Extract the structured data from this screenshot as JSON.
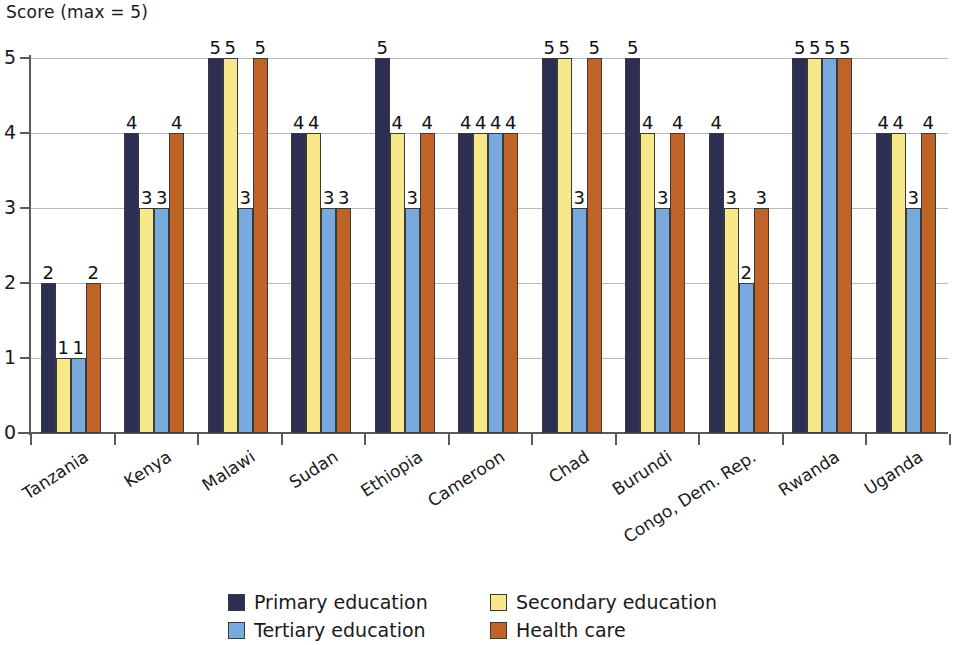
{
  "chart_data": {
    "type": "bar",
    "title": "Score (max = 5)",
    "xlabel": "",
    "ylabel": "Score (max = 5)",
    "ylim": [
      0,
      5
    ],
    "yticks": [
      0,
      1,
      2,
      3,
      4,
      5
    ],
    "grid": true,
    "legend_position": "bottom",
    "categories": [
      "Tanzania",
      "Kenya",
      "Malawi",
      "Sudan",
      "Ethiopia",
      "Cameroon",
      "Chad",
      "Burundi",
      "Congo, Dem. Rep.",
      "Rwanda",
      "Uganda"
    ],
    "series": [
      {
        "name": "Primary education",
        "color": "#2d2e54",
        "values": [
          2,
          4,
          5,
          4,
          5,
          4,
          5,
          5,
          4,
          5,
          4
        ]
      },
      {
        "name": "Secondary education",
        "color": "#f7e98a",
        "values": [
          1,
          3,
          5,
          4,
          4,
          4,
          5,
          4,
          3,
          5,
          4
        ]
      },
      {
        "name": "Tertiary education",
        "color": "#78aadd",
        "values": [
          1,
          3,
          3,
          3,
          3,
          4,
          3,
          3,
          2,
          5,
          3
        ]
      },
      {
        "name": "Health care",
        "color": "#bf6328",
        "values": [
          2,
          4,
          5,
          3,
          4,
          4,
          5,
          4,
          3,
          5,
          4
        ]
      }
    ]
  }
}
